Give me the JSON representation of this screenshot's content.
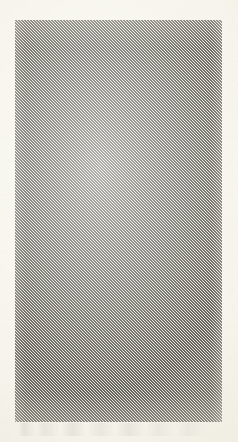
{
  "page": {
    "kind": "scanned-document-page",
    "width_px": 238,
    "height_px": 442,
    "paper_color": "#f5f3ea",
    "visible_text": "",
    "notes_visible_in_pixels": "no legible text; page contains a single diagonally hatched rectangular block"
  },
  "hatch_block": {
    "label": "",
    "left_px": 15,
    "top_px": 20,
    "width_px": 207,
    "height_px": 402,
    "stripe_direction": "diagonal-up-right",
    "stripe_angle_deg": 45,
    "stripe_period_px": 3,
    "stripe_color": "#4f4e45",
    "gap_color": "#f5f3ea"
  },
  "margins": {
    "left_px": 15,
    "right_px": 16,
    "top_px": 20,
    "bottom_px": 20,
    "color": "#f5f3ea"
  },
  "artifacts": {
    "showthrough_text_visible": "faint illegible ghosting in lower margin",
    "grain": "paper speckle"
  }
}
